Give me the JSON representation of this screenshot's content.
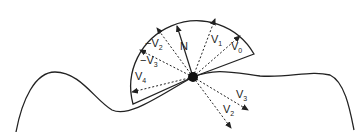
{
  "diagram": {
    "labels": {
      "normal": "N",
      "v0": "V",
      "v0_sub": "0",
      "v1": "V",
      "v1_sub": "1",
      "neg_v2": "−V",
      "neg_v2_sub": "2",
      "neg_v3": "−V",
      "neg_v3_sub": "3",
      "v4": "V",
      "v4_sub": "4",
      "v3": "V",
      "v3_sub": "3",
      "v2": "V",
      "v2_sub": "2"
    },
    "colors": {
      "stroke": "#222222",
      "background": "#ffffff"
    }
  }
}
